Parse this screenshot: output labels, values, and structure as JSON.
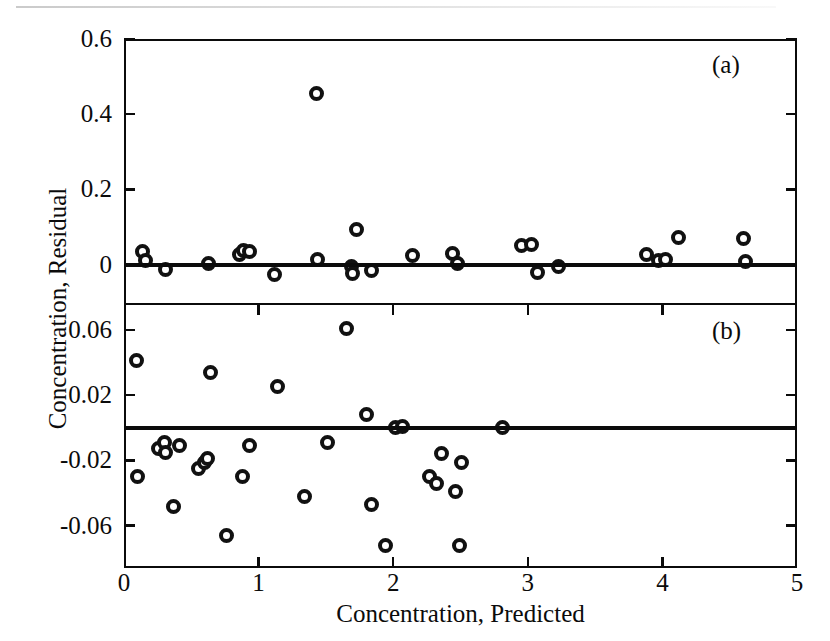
{
  "figure": {
    "panel_tags": {
      "a": "(a)",
      "b": "(b)"
    }
  },
  "axes": {
    "x_title": "Concentration, Predicted",
    "y_title": "Concentration, Residual",
    "x_ticks": [
      "0",
      "1",
      "2",
      "3",
      "4",
      "5"
    ],
    "y_ticks_a": [
      "0.6",
      "0.4",
      "0.2",
      "0"
    ],
    "y_ticks_b": [
      "0.06",
      "0.02",
      "-0.02",
      "-0.06"
    ]
  },
  "colors": {
    "ink": "#0b0b0b",
    "marker_edge": "#111111",
    "marker_fill": "#ffffff",
    "background": "#ffffff"
  },
  "chart_data": {
    "type": "scatter",
    "title": "",
    "xlabel": "Concentration, Predicted",
    "ylabel": "Concentration, Residual",
    "grid": false,
    "legend": "none",
    "panels": [
      {
        "tag": "(a)",
        "xlim": [
          0,
          5
        ],
        "ylim": [
          -0.105,
          0.6
        ],
        "yticks": [
          0,
          0.2,
          0.4,
          0.6
        ],
        "xticks": [
          0,
          1,
          2,
          3,
          4,
          5
        ],
        "reference_line": 0,
        "points": [
          {
            "x": 0.14,
            "y": 0.035
          },
          {
            "x": 0.16,
            "y": 0.012
          },
          {
            "x": 0.31,
            "y": -0.014
          },
          {
            "x": 0.63,
            "y": 0.002
          },
          {
            "x": 0.86,
            "y": 0.027
          },
          {
            "x": 0.89,
            "y": 0.038
          },
          {
            "x": 0.93,
            "y": 0.034
          },
          {
            "x": 1.12,
            "y": -0.026
          },
          {
            "x": 1.43,
            "y": 0.455
          },
          {
            "x": 1.44,
            "y": 0.013
          },
          {
            "x": 1.69,
            "y": -0.006
          },
          {
            "x": 1.7,
            "y": -0.024
          },
          {
            "x": 1.73,
            "y": 0.093
          },
          {
            "x": 1.84,
            "y": -0.017
          },
          {
            "x": 2.14,
            "y": 0.023
          },
          {
            "x": 2.44,
            "y": 0.03
          },
          {
            "x": 2.48,
            "y": 0.004
          },
          {
            "x": 2.95,
            "y": 0.05
          },
          {
            "x": 3.03,
            "y": 0.053
          },
          {
            "x": 3.07,
            "y": -0.02
          },
          {
            "x": 3.23,
            "y": -0.006
          },
          {
            "x": 3.88,
            "y": 0.026
          },
          {
            "x": 3.97,
            "y": 0.012
          },
          {
            "x": 4.02,
            "y": 0.014
          },
          {
            "x": 4.12,
            "y": 0.072
          },
          {
            "x": 4.6,
            "y": 0.07
          },
          {
            "x": 4.62,
            "y": 0.009
          }
        ]
      },
      {
        "tag": "(b)",
        "xlim": [
          0,
          5
        ],
        "ylim": [
          -0.086,
          0.0765
        ],
        "yticks": [
          -0.06,
          -0.02,
          0.02,
          0.06
        ],
        "xticks": [
          0,
          1,
          2,
          3,
          4,
          5
        ],
        "reference_line": 0,
        "points": [
          {
            "x": 0.09,
            "y": 0.041
          },
          {
            "x": 0.1,
            "y": -0.03
          },
          {
            "x": 0.26,
            "y": -0.013
          },
          {
            "x": 0.3,
            "y": -0.009
          },
          {
            "x": 0.31,
            "y": -0.015
          },
          {
            "x": 0.37,
            "y": -0.048
          },
          {
            "x": 0.41,
            "y": -0.011
          },
          {
            "x": 0.55,
            "y": -0.025
          },
          {
            "x": 0.6,
            "y": -0.021
          },
          {
            "x": 0.62,
            "y": -0.019
          },
          {
            "x": 0.64,
            "y": 0.034
          },
          {
            "x": 0.76,
            "y": -0.066
          },
          {
            "x": 0.88,
            "y": -0.03
          },
          {
            "x": 0.93,
            "y": -0.011
          },
          {
            "x": 1.14,
            "y": 0.025
          },
          {
            "x": 1.34,
            "y": -0.042
          },
          {
            "x": 1.51,
            "y": -0.009
          },
          {
            "x": 1.65,
            "y": 0.061
          },
          {
            "x": 1.8,
            "y": 0.008
          },
          {
            "x": 1.84,
            "y": -0.047
          },
          {
            "x": 1.94,
            "y": -0.072
          },
          {
            "x": 2.02,
            "y": 0.0
          },
          {
            "x": 2.07,
            "y": 0.001
          },
          {
            "x": 2.27,
            "y": -0.03
          },
          {
            "x": 2.32,
            "y": -0.034
          },
          {
            "x": 2.36,
            "y": -0.016
          },
          {
            "x": 2.46,
            "y": -0.039
          },
          {
            "x": 2.49,
            "y": -0.072
          },
          {
            "x": 2.51,
            "y": -0.021
          },
          {
            "x": 2.81,
            "y": 0.0
          }
        ]
      }
    ]
  }
}
